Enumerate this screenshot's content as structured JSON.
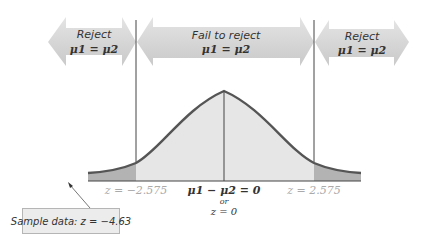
{
  "diagram": {
    "regions": [
      {
        "label": "Reject",
        "hypothesis": "μ1 = μ2",
        "position": "left"
      },
      {
        "label": "Fail to reject",
        "hypothesis": "μ1 = μ2",
        "position": "center"
      },
      {
        "label": "Reject",
        "hypothesis": "μ1 = μ2",
        "position": "right"
      }
    ],
    "critical_values": {
      "left": "z = −2.575",
      "right": "z = 2.575"
    },
    "center_label": {
      "line1": "μ1 − μ2 = 0",
      "line2": "or",
      "line3": "z = 0"
    },
    "sample_data": "Sample data: z = −4.63",
    "colors": {
      "arrow_fill": "#d6d6d6",
      "curve_stroke": "#555555",
      "body_fill": "#e6e6e6",
      "tail_fill": "#b3b3b3",
      "axis": "#444444"
    }
  }
}
